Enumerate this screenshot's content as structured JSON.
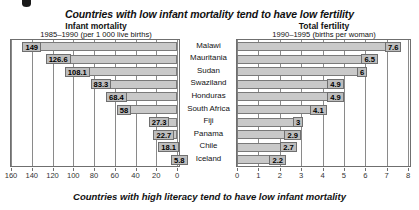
{
  "page": {
    "main_title": "Countries with low infant mortality tend to have low fertility",
    "footer_title": "Countries with high literacy tend to have low infant mortality",
    "corner_mark": "page-corner-mark"
  },
  "left_panel": {
    "title": "Infant mortality",
    "subtitle": "1985–1990 (per 1 000 live births)"
  },
  "right_panel": {
    "title": "Total fertility",
    "subtitle": "1990–1995 (births per woman)"
  },
  "colors": {
    "bar_fill": "#c9c9c9",
    "bar_border": "#7a7a7a",
    "label_fill": "#bdbdbd",
    "gridline": "#8a8a8a",
    "text": "#111111",
    "background": "#ffffff"
  },
  "chart_data": [
    {
      "type": "bar",
      "orientation": "horizontal",
      "direction": "right-to-left",
      "title": "Infant mortality",
      "subtitle": "1985–1990 (per 1 000 live births)",
      "xlabel": "",
      "ylabel": "",
      "xlim": [
        160,
        0
      ],
      "xticks": [
        160,
        140,
        120,
        100,
        80,
        60,
        40,
        20,
        0
      ],
      "xtick_labels": [
        "160",
        "140",
        "120",
        "100",
        "80",
        "60",
        "40",
        "20",
        "0"
      ],
      "grid": true,
      "legend": "none",
      "categories": [
        "Malawi",
        "Mauritania",
        "Sudan",
        "Swaziland",
        "Honduras",
        "South Africa",
        "Fiji",
        "Panama",
        "Chile",
        "Iceland"
      ],
      "values": [
        149,
        126.6,
        108.1,
        83.3,
        68.4,
        58,
        27.3,
        22.7,
        18.1,
        5.8
      ],
      "value_labels": [
        "149",
        "126.6",
        "108.1",
        "83.3",
        "68.4",
        "58",
        "27.3",
        "22.7",
        "18.1",
        "5.8"
      ]
    },
    {
      "type": "bar",
      "orientation": "horizontal",
      "direction": "left-to-right",
      "title": "Total fertility",
      "subtitle": "1990–1995 (births per woman)",
      "xlabel": "",
      "ylabel": "",
      "xlim": [
        0,
        8
      ],
      "xticks": [
        0,
        1,
        2,
        3,
        4,
        5,
        6,
        7,
        8
      ],
      "xtick_labels": [
        "0",
        "1",
        "2",
        "3",
        "4",
        "5",
        "6",
        "7",
        "8"
      ],
      "grid": true,
      "legend": "none",
      "categories": [
        "Malawi",
        "Mauritania",
        "Sudan",
        "Swaziland",
        "Honduras",
        "South Africa",
        "Fiji",
        "Panama",
        "Chile",
        "Iceland"
      ],
      "values": [
        7.6,
        6.5,
        6,
        4.9,
        4.9,
        4.1,
        3,
        2.9,
        2.7,
        2.2
      ],
      "value_labels": [
        "7.6",
        "6.5",
        "6",
        "4.9",
        "4.9",
        "4.1",
        "3",
        "2.9",
        "2.7",
        "2.2"
      ]
    }
  ]
}
